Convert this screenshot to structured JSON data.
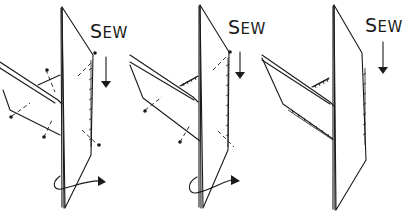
{
  "figure": {
    "panels": [
      {
        "id": "step-1",
        "label_first": "S",
        "label_rest": "EW",
        "state": "pinned, partially sewn"
      },
      {
        "id": "step-2",
        "label_first": "S",
        "label_rest": "EW",
        "state": "one side sewn, second pinned"
      },
      {
        "id": "step-3",
        "label_first": "S",
        "label_rest": "EW",
        "state": "all seams sewn"
      }
    ],
    "colors": {
      "ink": "#1a1a1a",
      "background": "#ffffff"
    }
  }
}
